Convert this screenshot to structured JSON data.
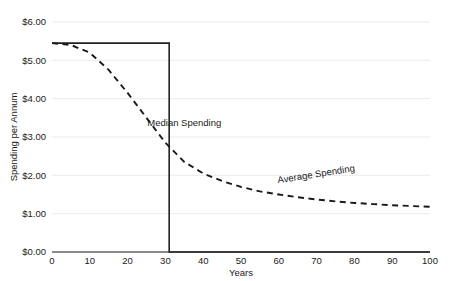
{
  "chart_data": {
    "type": "line",
    "title": "",
    "xlabel": "Years",
    "ylabel": "Spending per Annum",
    "xlim": [
      0,
      100
    ],
    "ylim": [
      0,
      6
    ],
    "grid": true,
    "legend_position": "inline-annotation",
    "x_ticks": [
      0,
      10,
      20,
      30,
      40,
      50,
      60,
      70,
      80,
      90,
      100
    ],
    "x_tick_labels": [
      "0",
      "10",
      "20",
      "30",
      "40",
      "50",
      "60",
      "70",
      "80",
      "90",
      "100"
    ],
    "y_ticks": [
      0,
      1,
      2,
      3,
      4,
      5,
      6
    ],
    "y_tick_labels": [
      "$0.00",
      "$1.00",
      "$2.00",
      "$3.00",
      "$4.00",
      "$5.00",
      "$6.00"
    ],
    "series": [
      {
        "name": "Median Spending",
        "style": "solid",
        "label_x": 35,
        "label_y": 3.3,
        "label_rotation": 0,
        "x": [
          0,
          31,
          31,
          100
        ],
        "values": [
          5.45,
          5.45,
          0,
          0
        ]
      },
      {
        "name": "Average Spending",
        "style": "dashed",
        "label_x": 70,
        "label_y": 1.95,
        "label_rotation": -9,
        "x": [
          0,
          5,
          10,
          15,
          20,
          25,
          30,
          35,
          40,
          45,
          50,
          55,
          60,
          65,
          70,
          75,
          80,
          85,
          90,
          95,
          100
        ],
        "values": [
          5.45,
          5.4,
          5.2,
          4.75,
          4.15,
          3.5,
          2.85,
          2.35,
          2.05,
          1.85,
          1.7,
          1.58,
          1.5,
          1.43,
          1.37,
          1.32,
          1.28,
          1.25,
          1.22,
          1.2,
          1.18
        ]
      }
    ]
  },
  "colors": {
    "background": "#ffffff",
    "axis": "#1a1a1a",
    "grid": "#e9e9ec",
    "solid_series": "#222222",
    "dashed_series": "#1a1a1a",
    "text": "#1a1a1a"
  }
}
